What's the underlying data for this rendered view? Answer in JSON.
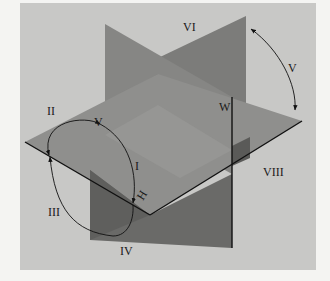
{
  "figure": {
    "planes": {
      "horizontal": "H",
      "frontal": "V",
      "profile": "W"
    },
    "octant_labels": {
      "I": "I",
      "II": "II",
      "III": "III",
      "IV": "IV",
      "V": "V",
      "VI": "VI",
      "VII": "VII",
      "VIII": "VIII"
    },
    "colors": {
      "background": "#f4f4f2",
      "panel": "#c8c8c6",
      "plane_light": "#8a8a88",
      "plane_mid": "#7b7b79",
      "plane_dark": "#5e5e5c",
      "line": "#111111"
    }
  }
}
